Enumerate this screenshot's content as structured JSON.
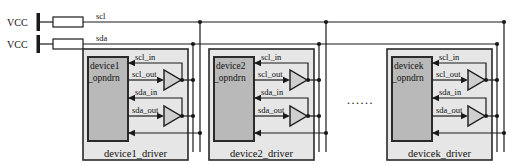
{
  "pullups": {
    "vcc_label": "VCC",
    "scl_label": "scl",
    "sda_label": "sda"
  },
  "devices": [
    {
      "id": "device1",
      "name_line1": "device1",
      "name_line2": "_opndrn",
      "driver_label": "device1_driver",
      "signals": {
        "scl_in": "scl_in",
        "scl_out": "scl_out",
        "sda_in": "sda_in",
        "sda_out": "sda_out"
      }
    },
    {
      "id": "device2",
      "name_line1": "device2",
      "name_line2": "_opndrn",
      "driver_label": "device2_driver",
      "signals": {
        "scl_in": "scl_in",
        "scl_out": "scl_out",
        "sda_in": "sda_in",
        "sda_out": "sda_out"
      }
    },
    {
      "id": "devicek",
      "name_line1": "devicek",
      "name_line2": "_opndrn",
      "driver_label": "devicek_driver",
      "signals": {
        "scl_in": "scl_in",
        "scl_out": "scl_out",
        "sda_in": "sda_in",
        "sda_out": "sda_out"
      }
    }
  ],
  "ellipsis": {
    "text": "......"
  },
  "colors": {
    "wire": "#1a1a1a",
    "box_stroke": "#2a2a2a",
    "driver_fill": "#e6e6e6",
    "opndrn_fill": "#b9b9b9",
    "buffer_fill": "#cfcfcf",
    "background": "#ffffff"
  }
}
